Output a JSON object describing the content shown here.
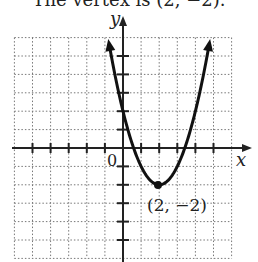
{
  "caption": "The vertex is (2, −2).",
  "graph": {
    "x_axis_label": "x",
    "y_axis_label": "y",
    "origin_label": "0",
    "vertex_label": "(2, −2)",
    "grid_range": {
      "xmin": -6,
      "xmax": 6,
      "ymin": -6,
      "ymax": 6
    }
  },
  "chart_data": {
    "type": "line",
    "title": "",
    "function": "y = (x - 2)^2 - 2",
    "xlabel": "x",
    "ylabel": "y",
    "xlim": [
      -6,
      6
    ],
    "ylim": [
      -6,
      6
    ],
    "grid": true,
    "vertex": {
      "x": 2,
      "y": -2,
      "label": "(2, −2)"
    },
    "series": [
      {
        "name": "parabola",
        "x": [
          -0.83,
          0,
          1,
          2,
          3,
          4,
          4.83
        ],
        "y": [
          6,
          2,
          -1,
          -2,
          -1,
          2,
          6
        ]
      }
    ]
  }
}
